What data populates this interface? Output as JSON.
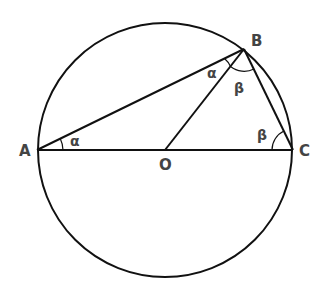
{
  "diagram": {
    "type": "geometry",
    "circle": {
      "center": "O",
      "cx": 165,
      "cy": 150,
      "r": 128
    },
    "points": {
      "A": {
        "label": "A",
        "x": 37,
        "y": 150
      },
      "B": {
        "label": "B",
        "x": 244,
        "y": 49
      },
      "C": {
        "label": "C",
        "x": 293,
        "y": 150
      },
      "O": {
        "label": "O",
        "x": 165,
        "y": 150
      }
    },
    "segments": [
      [
        "A",
        "C"
      ],
      [
        "A",
        "B"
      ],
      [
        "B",
        "C"
      ],
      [
        "O",
        "B"
      ]
    ],
    "angles": {
      "alpha_at_A": {
        "label": "α",
        "vertex": "A"
      },
      "alpha_at_B": {
        "label": "α",
        "vertex": "B"
      },
      "beta_at_B": {
        "label": "β",
        "vertex": "B"
      },
      "beta_at_C": {
        "label": "β",
        "vertex": "C"
      }
    },
    "colors": {
      "stroke": "#111111",
      "text": "#444444",
      "background": "#ffffff"
    }
  }
}
